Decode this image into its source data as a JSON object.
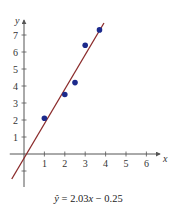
{
  "chart_data": {
    "type": "scatter",
    "title": "",
    "xlabel": "x",
    "ylabel": "y",
    "xlim": [
      -0.6,
      6.6
    ],
    "ylim": [
      -2.0,
      7.9
    ],
    "xticks": [
      1,
      2,
      3,
      4,
      5,
      6
    ],
    "yticks": [
      1,
      2,
      3,
      4,
      5,
      6,
      7
    ],
    "yticks_unlabeled": [
      -1
    ],
    "grid": false,
    "legend": null,
    "points": {
      "x": [
        1,
        2,
        2.5,
        3,
        3.7
      ],
      "y": [
        2.1,
        3.5,
        4.2,
        6.4,
        7.3
      ]
    },
    "regression_line": {
      "slope": 2.03,
      "intercept": -0.25,
      "x_range": [
        -0.6,
        3.92
      ]
    },
    "annotation": "ŷ = 2.03x − 0.25",
    "colors": {
      "points": "#1c2a8c",
      "line": "#8b2b2b",
      "axes": "#555555"
    }
  },
  "equation": {
    "lhs": "ŷ",
    "equals": " = ",
    "slope": "2.03",
    "var": "x",
    "minus": " − ",
    "intercept": "0.25"
  }
}
